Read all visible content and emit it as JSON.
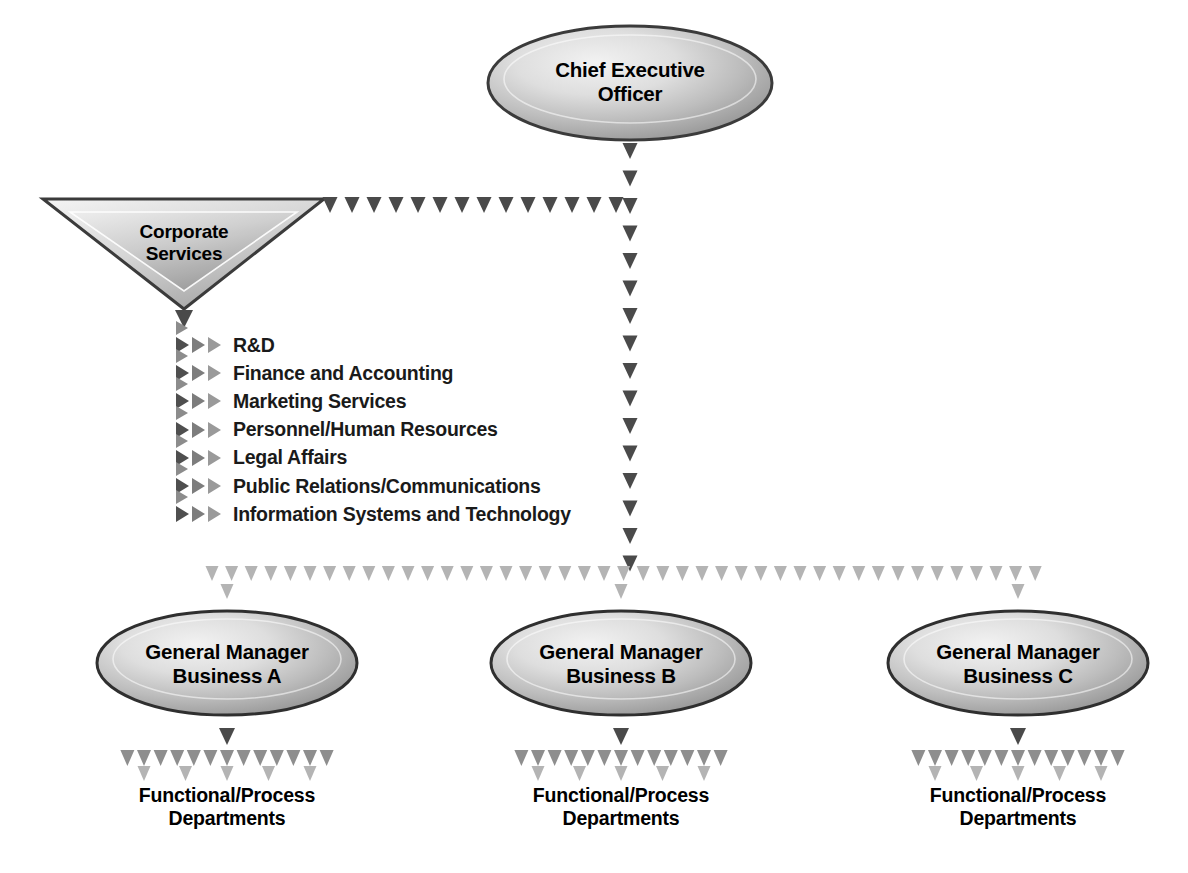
{
  "diagram": {
    "type": "org-chart",
    "background_color": "#ffffff",
    "colors": {
      "arrow_dark": "#4a4a4a",
      "arrow_mid": "#8e8e8e",
      "arrow_light": "#b4b4b4",
      "shape_outline": "#3b3b3b",
      "shape_fill_light": "#e8e8e8",
      "shape_fill_dark": "#9d9d9d",
      "text": "#000000"
    }
  },
  "nodes": {
    "ceo": {
      "label": "Chief Executive\nOfficer",
      "shape": "ellipse"
    },
    "corporate_services": {
      "label": "Corporate\nServices",
      "shape": "inverted-triangle"
    },
    "general_managers": [
      {
        "label": "General Manager\nBusiness A",
        "shape": "ellipse"
      },
      {
        "label": "General Manager\nBusiness B",
        "shape": "ellipse"
      },
      {
        "label": "General Manager\nBusiness C",
        "shape": "ellipse"
      }
    ],
    "departments": [
      {
        "label": "Functional/Process\nDepartments"
      },
      {
        "label": "Functional/Process\nDepartments"
      },
      {
        "label": "Functional/Process\nDepartments"
      }
    ]
  },
  "corporate_services_functions": [
    "R&D",
    "Finance and Accounting",
    "Marketing Services",
    "Personnel/Human Resources",
    "Legal Affairs",
    "Public Relations/Communications",
    "Information Systems and Technology"
  ],
  "connectors": {
    "ceo_to_trunk": "vertical dotted arrow chain",
    "ceo_to_corporate_services": "horizontal dotted arrow chain",
    "trunk_to_general_managers": "horizontal dotted arrow chain",
    "gm_to_departments": "fan of dotted arrows"
  }
}
